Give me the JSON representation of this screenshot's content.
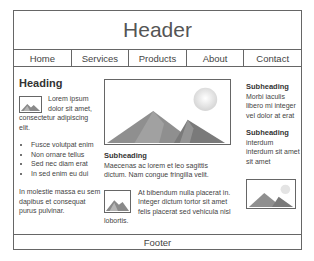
{
  "header": {
    "title": "Header"
  },
  "nav": {
    "items": [
      {
        "label": "Home"
      },
      {
        "label": "Services"
      },
      {
        "label": "Products"
      },
      {
        "label": "About"
      },
      {
        "label": "Contact"
      }
    ]
  },
  "left_column": {
    "heading": "Heading",
    "image_icon": "image-placeholder-icon",
    "intro_text": "Lorem ipsum dolor sit amet, consectetur adipiscing elit.",
    "bullets": [
      "Fusce volutpat enim",
      "Non ornare tellus",
      "Sed nec diam erat",
      "In sed enim eu dui"
    ],
    "paragraph": "In molestie massa eu sem dapibus et consequat purus pulvinar."
  },
  "center_column": {
    "hero_image_icon": "mountain-landscape-icon",
    "subheading": "Subheading",
    "paragraph1": "Maecenas ac lorem et leo sagittis dictum. Nam congue fringilla velit.",
    "image_icon": "image-placeholder-icon",
    "paragraph2": "At bibendum nulla placerat in. Integer dictum tortor sit amet felis placerat sed vehicula nisl lobortis."
  },
  "right_column": {
    "sections": [
      {
        "subheading": "Subheading",
        "text": "Morbi iaculis libero mi integer vel dolor at erat"
      },
      {
        "subheading": "Subheading",
        "text": "interdum interdum sit amet sit amet"
      }
    ],
    "image_icon": "mountain-landscape-icon"
  },
  "footer": {
    "label": "Footer"
  },
  "colors": {
    "border": "#666666",
    "text": "#444444",
    "background": "#ffffff"
  }
}
